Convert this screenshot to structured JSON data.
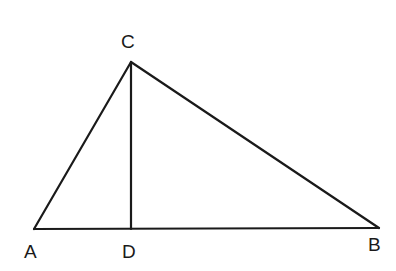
{
  "diagram": {
    "type": "triangle-with-altitude",
    "points": {
      "A": {
        "label": "A",
        "x": 34,
        "y": 229
      },
      "B": {
        "label": "B",
        "x": 379,
        "y": 228
      },
      "C": {
        "label": "C",
        "x": 131,
        "y": 62
      },
      "D": {
        "label": "D",
        "x": 131,
        "y": 229
      }
    },
    "segments": [
      "AC",
      "CB",
      "AB",
      "CD"
    ],
    "line_color": "#1a1a1a",
    "labels": {
      "A": "A",
      "B": "B",
      "C": "C",
      "D": "D"
    }
  }
}
